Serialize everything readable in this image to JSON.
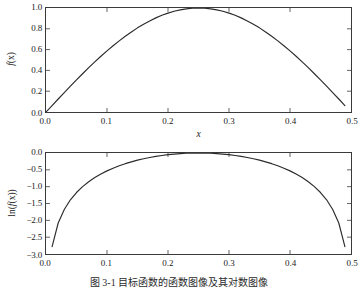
{
  "figure": {
    "caption": "图 3-1  目标函数的函数图像及其对数图像",
    "background": "#ffffff",
    "curve_color": "#2b2b2b",
    "axis_color": "#3a3a3a"
  },
  "panels": {
    "top": {
      "xlabel": "x",
      "ylabel_prefix": "f",
      "ylabel_suffix": "(x)",
      "xticks": [
        "0.0",
        "0.1",
        "0.2",
        "0.3",
        "0.4",
        "0.5"
      ],
      "yticks": [
        "1.0",
        "0.8",
        "0.6",
        "0.4",
        "0.2",
        "0.0"
      ]
    },
    "bottom": {
      "xlabel": "x",
      "ylabel_prefix": "ln(",
      "ylabel_mid": "f",
      "ylabel_suffix": "(x))",
      "xticks": [
        "0.0",
        "0.1",
        "0.2",
        "0.3",
        "0.4",
        "0.5"
      ],
      "yticks": [
        "0.0",
        "−0.5",
        "−1.0",
        "−1.5",
        "−2.0",
        "−2.5",
        "−3.0"
      ]
    }
  },
  "chart_data": [
    {
      "type": "line",
      "title": "",
      "xlabel": "x",
      "ylabel": "f(x)",
      "xlim": [
        0.0,
        0.5
      ],
      "ylim": [
        0.0,
        1.0
      ],
      "xticks": [
        0.0,
        0.1,
        0.2,
        0.3,
        0.4,
        0.5
      ],
      "yticks": [
        0.0,
        0.2,
        0.4,
        0.6,
        0.8,
        1.0
      ],
      "grid": false,
      "legend": null,
      "series": [
        {
          "name": "f(x)",
          "color": "#2b2b2b",
          "x": [
            0.0,
            0.01,
            0.02,
            0.03,
            0.04,
            0.05,
            0.06,
            0.07,
            0.08,
            0.09,
            0.1,
            0.11,
            0.12,
            0.13,
            0.14,
            0.15,
            0.16,
            0.17,
            0.18,
            0.19,
            0.2,
            0.21,
            0.22,
            0.23,
            0.24,
            0.25,
            0.26,
            0.27,
            0.28,
            0.29,
            0.3,
            0.31,
            0.32,
            0.33,
            0.34,
            0.35,
            0.36,
            0.37,
            0.38,
            0.39,
            0.4,
            0.41,
            0.42,
            0.43,
            0.44,
            0.45,
            0.46,
            0.47,
            0.48,
            0.49
          ],
          "y": [
            0.0,
            0.062,
            0.125,
            0.187,
            0.249,
            0.309,
            0.368,
            0.426,
            0.482,
            0.536,
            0.588,
            0.637,
            0.684,
            0.728,
            0.769,
            0.809,
            0.844,
            0.876,
            0.905,
            0.93,
            0.951,
            0.969,
            0.982,
            0.992,
            0.998,
            1.0,
            0.998,
            0.992,
            0.982,
            0.969,
            0.951,
            0.93,
            0.905,
            0.876,
            0.844,
            0.809,
            0.769,
            0.728,
            0.684,
            0.637,
            0.588,
            0.536,
            0.482,
            0.426,
            0.368,
            0.309,
            0.249,
            0.187,
            0.125,
            0.062
          ]
        }
      ]
    },
    {
      "type": "line",
      "title": "",
      "xlabel": "x",
      "ylabel": "ln(f(x))",
      "xlim": [
        0.0,
        0.5
      ],
      "ylim": [
        -3.0,
        0.0
      ],
      "xticks": [
        0.0,
        0.1,
        0.2,
        0.3,
        0.4,
        0.5
      ],
      "yticks": [
        -3.0,
        -2.5,
        -2.0,
        -1.5,
        -1.0,
        -0.5,
        0.0
      ],
      "grid": false,
      "legend": null,
      "series": [
        {
          "name": "ln(f(x))",
          "color": "#2b2b2b",
          "x": [
            0.01,
            0.02,
            0.03,
            0.04,
            0.05,
            0.06,
            0.07,
            0.08,
            0.09,
            0.1,
            0.11,
            0.12,
            0.13,
            0.14,
            0.15,
            0.16,
            0.17,
            0.18,
            0.19,
            0.2,
            0.21,
            0.22,
            0.23,
            0.24,
            0.25,
            0.26,
            0.27,
            0.28,
            0.29,
            0.3,
            0.31,
            0.32,
            0.33,
            0.34,
            0.35,
            0.36,
            0.37,
            0.38,
            0.39,
            0.4,
            0.41,
            0.42,
            0.43,
            0.44,
            0.45,
            0.46,
            0.47,
            0.48,
            0.49
          ],
          "y": [
            -2.78,
            -2.079,
            -1.677,
            -1.39,
            -1.174,
            -1.0,
            -0.853,
            -0.73,
            -0.624,
            -0.531,
            -0.451,
            -0.38,
            -0.317,
            -0.263,
            -0.212,
            -0.17,
            -0.132,
            -0.1,
            -0.073,
            -0.05,
            -0.032,
            -0.018,
            -0.008,
            -0.002,
            0.0,
            -0.002,
            -0.008,
            -0.018,
            -0.032,
            -0.05,
            -0.073,
            -0.1,
            -0.132,
            -0.17,
            -0.212,
            -0.263,
            -0.317,
            -0.38,
            -0.451,
            -0.531,
            -0.624,
            -0.73,
            -0.853,
            -1.0,
            -1.174,
            -1.39,
            -1.677,
            -2.079,
            -2.78
          ]
        }
      ]
    }
  ]
}
